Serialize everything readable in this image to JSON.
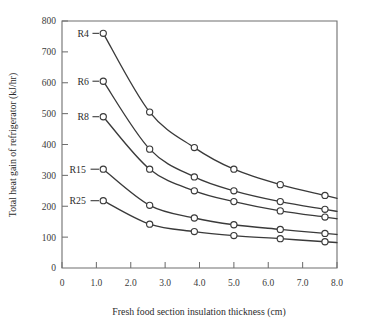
{
  "chart_data": {
    "type": "line",
    "title": "",
    "xlabel": "Fresh food section insulation thickness (cm)",
    "ylabel": "Total heat gain of refrigerator (kJ/hr)",
    "xlim": [
      0,
      8.0
    ],
    "ylim": [
      0,
      800
    ],
    "xticks": [
      0,
      1.0,
      2.0,
      3.0,
      4.0,
      5.0,
      6.0,
      7.0,
      8.0
    ],
    "xticklabels": [
      "0",
      "1.0",
      "2.0",
      "3.0",
      "4.0",
      "5.0",
      "6.0",
      "7.0",
      "8.0"
    ],
    "yticks": [
      0,
      100,
      200,
      300,
      400,
      500,
      600,
      700,
      800
    ],
    "yticklabels": [
      "0",
      "100",
      "200",
      "300",
      "400",
      "500",
      "600",
      "700",
      "800"
    ],
    "grid": false,
    "legend": "inline-left-labels",
    "x": [
      1.2,
      2.55,
      3.85,
      5.0,
      6.35,
      7.65
    ],
    "series": [
      {
        "name": "R4",
        "label": "R4",
        "values": [
          760,
          505,
          390,
          320,
          270,
          235
        ],
        "label_x": 0.45,
        "label_y": 760
      },
      {
        "name": "R6",
        "label": "R6",
        "values": [
          605,
          385,
          295,
          250,
          215,
          190
        ],
        "label_x": 0.45,
        "label_y": 605
      },
      {
        "name": "R8",
        "label": "R8",
        "values": [
          490,
          320,
          250,
          215,
          185,
          165
        ],
        "label_x": 0.45,
        "label_y": 490
      },
      {
        "name": "R15",
        "label": "R15",
        "values": [
          320,
          203,
          162,
          140,
          125,
          112
        ],
        "label_x": 0.22,
        "label_y": 320
      },
      {
        "name": "R25",
        "label": "R25",
        "values": [
          218,
          142,
          118,
          105,
          95,
          85
        ],
        "label_x": 0.22,
        "label_y": 218
      }
    ]
  },
  "style": {
    "axis_color": "#6f6f6f",
    "curve_color": "#3a3a3a",
    "marker_fill": "#ffffff",
    "text_color": "#2b2b2b",
    "background": "#ffffff"
  }
}
